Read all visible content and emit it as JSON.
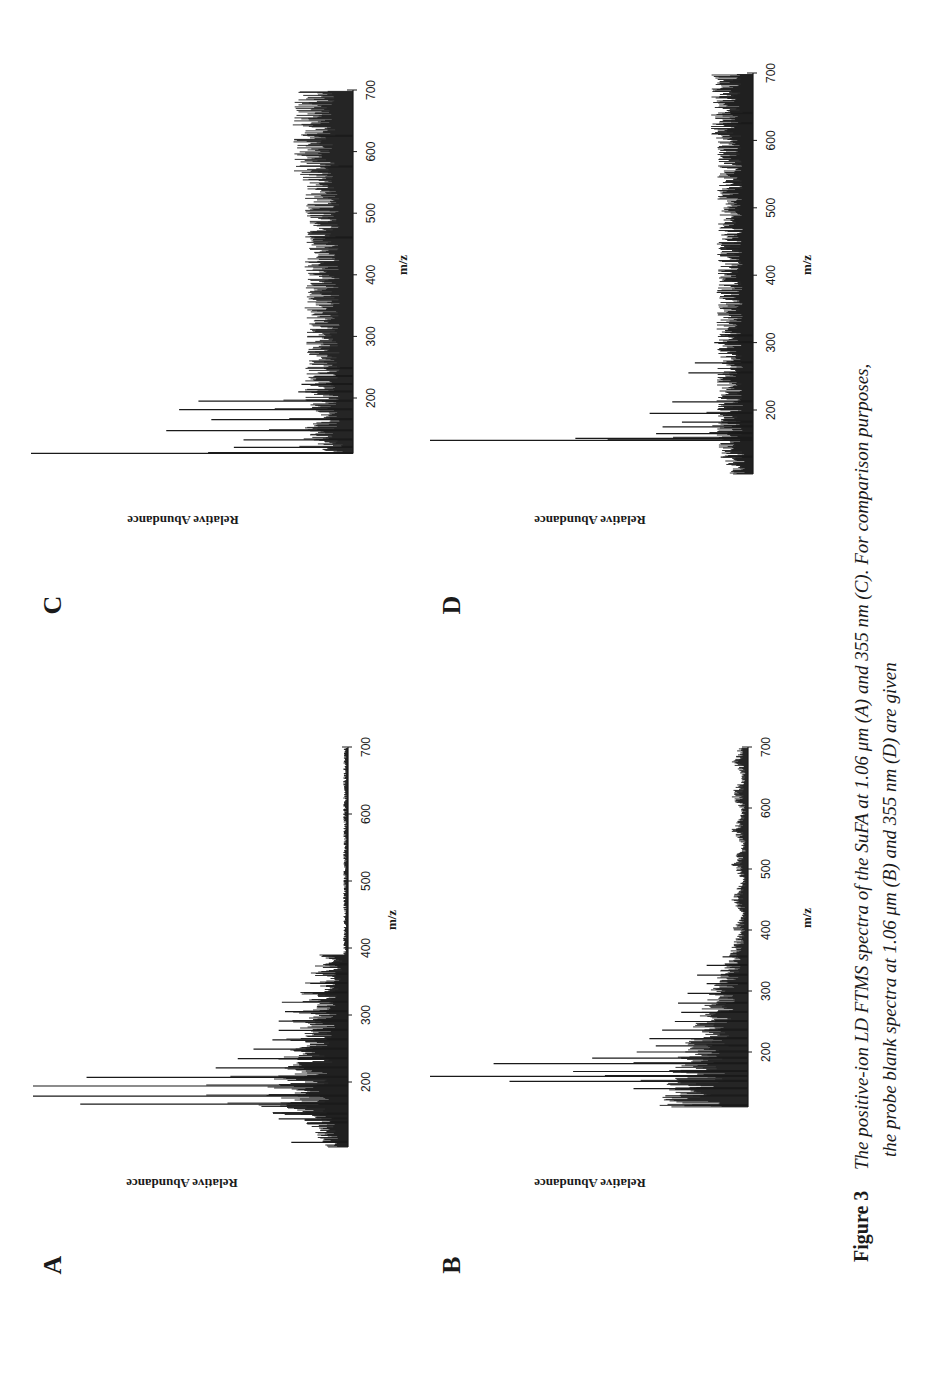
{
  "figure": {
    "number_label": "Figure 3",
    "caption_line1": "The positive-ion LD FTMS spectra of the SuFA at 1.06 μm (A) and 355 nm (C). For comparison purposes,",
    "caption_line2": "the probe blank spectra at 1.06 μm (B) and 355 nm (D) are given",
    "orientation": "page rotated 90° counter-clockwise"
  },
  "chart_data": [
    {
      "panel": "A",
      "type": "bar",
      "title": "Positive-ion LD FTMS spectrum of SuFA at 1.06 μm",
      "xlabel": "m/z",
      "ylabel": "Relative Abundance",
      "xlim": [
        100,
        700
      ],
      "xticks": [
        200,
        300,
        400,
        500,
        600,
        700
      ],
      "grid": false,
      "noise_profile": "dense cluster 150-400 with regular ~14 Da spaced peaks, decaying to flat baseline beyond 420",
      "peaks_mz": [
        110,
        139,
        145,
        152,
        167,
        179,
        194,
        207,
        221,
        235,
        249,
        263,
        277,
        291,
        305,
        319,
        333,
        347,
        361,
        375
      ],
      "peaks_rel": [
        18,
        13,
        22,
        15,
        85,
        100,
        100,
        83,
        42,
        35,
        30,
        24,
        22,
        22,
        20,
        21,
        14,
        12,
        8,
        6
      ]
    },
    {
      "panel": "B",
      "type": "bar",
      "title": "Probe blank spectrum at 1.06 μm",
      "xlabel": "m/z",
      "ylabel": "Relative Abundance",
      "xlim": [
        100,
        700
      ],
      "xticks": [
        200,
        300,
        400,
        500,
        600,
        700
      ],
      "grid": false,
      "noise_profile": "dense cluster 110-400 decaying, small periodic bumps 420-700",
      "peaks_mz": [
        112,
        128,
        140,
        152,
        160,
        168,
        181,
        190,
        200,
        210,
        222,
        236,
        250,
        265,
        280,
        296,
        312,
        326,
        342,
        356
      ],
      "peaks_rel": [
        20,
        26,
        36,
        75,
        100,
        55,
        80,
        49,
        35,
        29,
        31,
        27,
        23,
        21,
        22,
        19,
        13,
        16,
        13,
        8
      ]
    },
    {
      "panel": "C",
      "type": "bar",
      "title": "Positive-ion LD FTMS spectrum of SuFA at 355 nm",
      "xlabel": "m/z",
      "ylabel": "Relative Abundance",
      "xlim": [
        100,
        700
      ],
      "xticks": [
        200,
        300,
        400,
        500,
        600,
        700
      ],
      "grid": false,
      "noise_profile": "dense noisy baseline ~10-15% across 110-700",
      "peaks_mz": [
        110,
        120,
        132,
        147,
        165,
        181,
        195,
        210,
        222,
        235,
        248,
        460,
        575,
        625
      ],
      "peaks_rel": [
        100,
        37,
        34,
        58,
        44,
        54,
        48,
        17,
        16,
        12,
        9,
        12,
        10,
        12
      ]
    },
    {
      "panel": "D",
      "type": "bar",
      "title": "Probe blank spectrum at 355 nm",
      "xlabel": "m/z",
      "ylabel": "Relative Abundance",
      "xlim": [
        100,
        700
      ],
      "xticks": [
        200,
        300,
        400,
        500,
        600,
        700
      ],
      "grid": false,
      "noise_profile": "dense noisy baseline ~8-12% across 110-700",
      "peaks_mz": [
        130,
        155,
        158,
        165,
        175,
        182,
        195,
        212,
        255,
        270,
        300,
        310,
        625,
        640
      ],
      "peaks_rel": [
        10,
        100,
        55,
        30,
        28,
        22,
        32,
        25,
        20,
        18,
        12,
        10,
        8,
        7
      ]
    }
  ],
  "panels": [
    {
      "letter": "A",
      "ylabel": "Relative Abundance",
      "xlabel": "m/z",
      "axis_x": 348,
      "y_at_200": 1082,
      "y_at_700": 747,
      "max_height": 315,
      "mz_start": 103,
      "letter_pos": [
        52,
        1265
      ],
      "ylabel_pos": [
        182,
        1183
      ],
      "xlabel_pos": [
        392,
        920
      ]
    },
    {
      "letter": "B",
      "ylabel": "Relative Abundance",
      "xlabel": "m/z",
      "axis_x": 748,
      "y_at_200": 1052,
      "y_at_700": 747,
      "max_height": 318,
      "mz_start": 110,
      "letter_pos": [
        451,
        1265
      ],
      "ylabel_pos": [
        590,
        1183
      ],
      "xlabel_pos": [
        807,
        918
      ]
    },
    {
      "letter": "C",
      "ylabel": "Relative Abundance",
      "xlabel": "m/z",
      "axis_x": 353,
      "y_at_200": 398,
      "y_at_700": 90,
      "max_height": 322,
      "mz_start": 110,
      "letter_pos": [
        52,
        605
      ],
      "ylabel_pos": [
        183,
        520
      ],
      "xlabel_pos": [
        403,
        265
      ]
    },
    {
      "letter": "D",
      "ylabel": "Relative Abundance",
      "xlabel": "m/z",
      "axis_x": 753,
      "y_at_200": 410,
      "y_at_700": 73,
      "max_height": 323,
      "mz_start": 105,
      "letter_pos": [
        451,
        605
      ],
      "ylabel_pos": [
        590,
        520
      ],
      "xlabel_pos": [
        807,
        265
      ]
    }
  ],
  "colors": {
    "ink": "#1a1a1a",
    "background": "#ffffff"
  }
}
